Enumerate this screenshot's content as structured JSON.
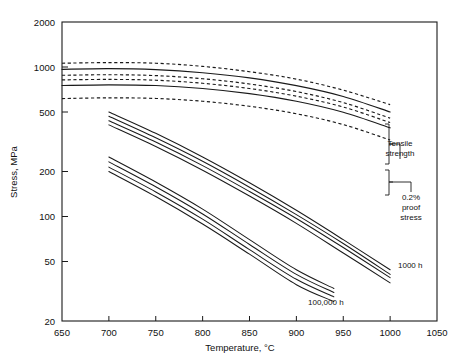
{
  "figure": {
    "kind": "scientific-line-chart",
    "background": "#ffffff",
    "ink_color": "#1a1a1a"
  },
  "axes": {
    "x_title": "Temperature, °C",
    "y_title": "Stress, MPa",
    "x_ticks": [
      "650",
      "700",
      "750",
      "800",
      "850",
      "900",
      "950",
      "1000",
      "1050"
    ],
    "y_ticks": [
      "2000",
      "1000",
      "500",
      "200",
      "100",
      "50",
      "20"
    ]
  },
  "annotations": {
    "tensile_strength": "Tensile\nstrength",
    "tensile_strength_line1": "Tensile",
    "tensile_strength_line2": "strength",
    "proof_stress_line1": "0.2%",
    "proof_stress_line2": "proof",
    "proof_stress_line3": "stress",
    "creep_1000h": "1000 h",
    "creep_100000h": "100,000 h"
  },
  "chart_data": {
    "type": "line",
    "title": "",
    "xlabel": "Temperature, °C",
    "ylabel": "Stress, MPa",
    "xscale": "linear",
    "yscale": "log",
    "xlim": [
      650,
      1050
    ],
    "ylim": [
      20,
      2000
    ],
    "xticks": [
      650,
      700,
      750,
      800,
      850,
      900,
      950,
      1000,
      1050
    ],
    "yticks": [
      20,
      50,
      100,
      200,
      500,
      1000,
      2000
    ],
    "grid": false,
    "legend": "none (curves labelled in-plot and by braces at right)",
    "series": [
      {
        "name": "Tensile strength upper bound",
        "group": "tensile-strength",
        "style": "dashed",
        "x": [
          650,
          700,
          750,
          800,
          850,
          900,
          950,
          1000
        ],
        "values": [
          1060,
          1070,
          1060,
          1010,
          930,
          830,
          700,
          560
        ]
      },
      {
        "name": "Tensile strength mean",
        "group": "tensile-strength",
        "style": "solid",
        "x": [
          650,
          700,
          750,
          800,
          850,
          900,
          950,
          1000
        ],
        "values": [
          965,
          975,
          960,
          915,
          845,
          750,
          635,
          500
        ]
      },
      {
        "name": "Tensile strength lower bound",
        "group": "tensile-strength",
        "style": "dashed",
        "x": [
          650,
          700,
          750,
          800,
          850,
          900,
          950,
          1000
        ],
        "values": [
          880,
          888,
          876,
          835,
          770,
          685,
          578,
          455
        ]
      },
      {
        "name": "0.2% proof stress upper bound",
        "group": "proof-stress",
        "style": "dashed",
        "x": [
          650,
          700,
          750,
          800,
          850,
          900,
          950,
          1000
        ],
        "values": [
          820,
          826,
          816,
          778,
          718,
          638,
          540,
          425
        ]
      },
      {
        "name": "0.2% proof stress mean",
        "group": "proof-stress",
        "style": "solid",
        "x": [
          650,
          700,
          750,
          800,
          850,
          900,
          950,
          1000
        ],
        "values": [
          752,
          760,
          752,
          718,
          663,
          590,
          498,
          392
        ]
      },
      {
        "name": "0.2% proof stress lower bound",
        "group": "proof-stress",
        "style": "dashed",
        "x": [
          650,
          700,
          750,
          800,
          850,
          900,
          950,
          1000
        ],
        "values": [
          615,
          622,
          616,
          590,
          546,
          487,
          412,
          325
        ]
      },
      {
        "name": "Creep rupture 1000 h, band 1 upper",
        "group": "creep-1000h",
        "style": "solid",
        "x": [
          700,
          750,
          800,
          850,
          900,
          950,
          1000
        ],
        "values": [
          500,
          360,
          250,
          168,
          110,
          70,
          44
        ]
      },
      {
        "name": "Creep rupture 1000 h, band 1 lower",
        "group": "creep-1000h",
        "style": "solid",
        "x": [
          700,
          750,
          800,
          850,
          900,
          950,
          1000
        ],
        "values": [
          468,
          336,
          234,
          157,
          103,
          66,
          41
        ]
      },
      {
        "name": "Creep rupture 1000 h, band 2 upper",
        "group": "creep-1000h",
        "style": "solid",
        "x": [
          700,
          750,
          800,
          850,
          900,
          950,
          1000
        ],
        "values": [
          437,
          315,
          219,
          147,
          97,
          62,
          39
        ]
      },
      {
        "name": "Creep rupture 1000 h, band 2 lower",
        "group": "creep-1000h",
        "style": "solid",
        "x": [
          700,
          750,
          800,
          850,
          900,
          950,
          1000
        ],
        "values": [
          410,
          294,
          204,
          137,
          90,
          57,
          36
        ]
      },
      {
        "name": "Creep rupture 100,000 h, band 1 upper",
        "group": "creep-100000h",
        "style": "solid",
        "x": [
          700,
          750,
          800,
          850,
          900,
          940
        ],
        "values": [
          250,
          170,
          112,
          70,
          44,
          33
        ]
      },
      {
        "name": "Creep rupture 100,000 h, band 1 lower",
        "group": "creep-100000h",
        "style": "solid",
        "x": [
          700,
          750,
          800,
          850,
          900,
          940
        ],
        "values": [
          232,
          158,
          104,
          65,
          41,
          31
        ]
      },
      {
        "name": "Creep rupture 100,000 h, band 2 upper",
        "group": "creep-100000h",
        "style": "solid",
        "x": [
          700,
          750,
          800,
          850,
          900,
          940
        ],
        "values": [
          214,
          146,
          96,
          60,
          38,
          29
        ]
      },
      {
        "name": "Creep rupture 100,000 h, band 2 lower",
        "group": "creep-100000h",
        "style": "solid",
        "x": [
          700,
          750,
          800,
          850,
          900,
          940
        ],
        "values": [
          200,
          136,
          89,
          56,
          35,
          27
        ]
      }
    ]
  }
}
